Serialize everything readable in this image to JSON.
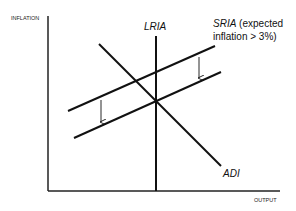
{
  "diagram": {
    "axes": {
      "y_label": "INFLATION",
      "x_label": "OUTPUT"
    },
    "curves": {
      "lria": {
        "label": "LRIA"
      },
      "adi": {
        "label": "ADI"
      },
      "sria": {
        "label_italic": "SRIA",
        "label_rest_line1": " (expected",
        "label_line2": "inflation > 3%)"
      }
    },
    "arrows": [
      {
        "direction": "down",
        "meaning": "SRIA shifts downward"
      },
      {
        "direction": "down",
        "meaning": "SRIA shifts downward"
      }
    ],
    "colors": {
      "line": "#111111",
      "background": "#ffffff"
    }
  }
}
